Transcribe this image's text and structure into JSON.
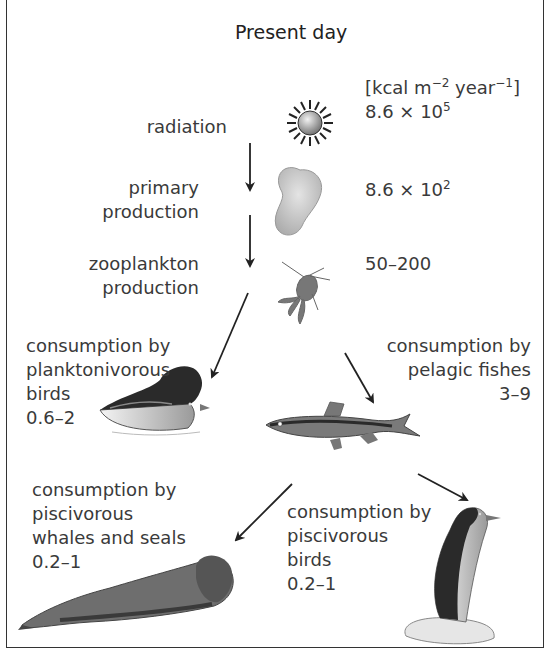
{
  "title": "Present day",
  "units": {
    "prefix": "[kcal m",
    "exp1": "−2",
    "mid": " year",
    "exp2": "−1",
    "suffix": "]"
  },
  "levels": [
    {
      "id": "radiation",
      "label_lines": [
        "radiation"
      ],
      "value_base": "8.6 × 10",
      "value_exp": "5",
      "icon": "sun-icon"
    },
    {
      "id": "primary_production",
      "label_lines": [
        "primary",
        "production"
      ],
      "value_base": "8.6 × 10",
      "value_exp": "2",
      "icon": "phytoplankton-icon"
    },
    {
      "id": "zooplankton_production",
      "label_lines": [
        "zooplankton",
        "production"
      ],
      "value": "50–200",
      "icon": "copepod-icon"
    },
    {
      "id": "planktonivorous_birds",
      "label_lines": [
        "consumption by",
        "planktonivorous",
        "birds"
      ],
      "value": "0.6–2",
      "icon": "auklet-icon"
    },
    {
      "id": "pelagic_fishes",
      "label_lines": [
        "consumption by",
        "pelagic fishes"
      ],
      "value": "3–9",
      "icon": "fish-icon"
    },
    {
      "id": "whales_seals",
      "label_lines": [
        "consumption by",
        "piscivorous",
        "whales and seals"
      ],
      "value": "0.2–1",
      "icon": "seal-icon"
    },
    {
      "id": "piscivorous_birds",
      "label_lines": [
        "consumption by",
        "piscivorous",
        "birds"
      ],
      "value": "0.2–1",
      "icon": "guillemot-icon"
    }
  ],
  "arrows": [
    {
      "from": "radiation",
      "to": "primary_production"
    },
    {
      "from": "primary_production",
      "to": "zooplankton_production"
    },
    {
      "from": "zooplankton_production",
      "to": "planktonivorous_birds"
    },
    {
      "from": "zooplankton_production",
      "to": "pelagic_fishes"
    },
    {
      "from": "pelagic_fishes",
      "to": "whales_seals"
    },
    {
      "from": "pelagic_fishes",
      "to": "piscivorous_birds"
    }
  ]
}
